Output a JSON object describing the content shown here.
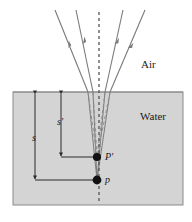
{
  "figure": {
    "media": {
      "upper_label": "Air",
      "lower_label": "Water",
      "water_fill_color": "#d4d4d4",
      "water_border_color": "#8a8a8a",
      "background_color": "#ffffff"
    },
    "points": [
      {
        "id": "object",
        "label": "p",
        "x": 97,
        "y": 180,
        "note": "actual object point"
      },
      {
        "id": "image",
        "label": "P'",
        "x": 97,
        "y": 157,
        "note": "apparent (virtual) image point"
      }
    ],
    "dimensions": [
      {
        "id": "true-depth",
        "label": "s",
        "x": 35,
        "y_top": 93,
        "y_bottom": 180
      },
      {
        "id": "apparent-depth",
        "label": "s'",
        "x": 61,
        "y_top": 93,
        "y_bottom": 157
      }
    ],
    "axis": {
      "id": "normal-line",
      "style": "dashed",
      "x": 99,
      "y_top": 12,
      "y_bottom": 204,
      "color": "#555555"
    },
    "rays": {
      "color": "#7a7a7a",
      "refracted_color": "#8a8a8a",
      "virtual_color": "#9a9a9a",
      "count": 4,
      "arrow_direction": "upward-outward",
      "air_rays": [
        {
          "id": "outer-left",
          "x_top": 55,
          "y_top": 10,
          "x_bottom": 88,
          "y_bottom": 92
        },
        {
          "id": "inner-left",
          "x_top": 76,
          "y_top": 10,
          "x_bottom": 93,
          "y_bottom": 92
        },
        {
          "id": "inner-right",
          "x_top": 123,
          "y_top": 10,
          "x_bottom": 105,
          "y_bottom": 92
        },
        {
          "id": "outer-right",
          "x_top": 145,
          "y_top": 10,
          "x_bottom": 110,
          "y_bottom": 92
        }
      ],
      "water_rays": [
        {
          "id": "water-outer-left",
          "x_top": 88,
          "y_top": 92,
          "x_bottom": 97,
          "y_bottom": 180
        },
        {
          "id": "water-inner-left",
          "x_top": 93,
          "y_top": 92,
          "x_bottom": 97,
          "y_bottom": 180
        },
        {
          "id": "water-inner-right",
          "x_top": 105,
          "y_top": 92,
          "x_bottom": 97,
          "y_bottom": 180
        },
        {
          "id": "water-outer-right",
          "x_top": 110,
          "y_top": 92,
          "x_bottom": 97,
          "y_bottom": 180
        }
      ],
      "virtual_rays": [
        {
          "id": "virtual-outer-left",
          "x_top": 88,
          "y_top": 92,
          "x_bottom": 97,
          "y_bottom": 157
        },
        {
          "id": "virtual-inner-left",
          "x_top": 93,
          "y_top": 92,
          "x_bottom": 97,
          "y_bottom": 157
        },
        {
          "id": "virtual-inner-right",
          "x_top": 105,
          "y_top": 92,
          "x_bottom": 97,
          "y_bottom": 157
        },
        {
          "id": "virtual-outer-right",
          "x_top": 110,
          "y_top": 92,
          "x_bottom": 97,
          "y_bottom": 157
        }
      ]
    },
    "water_rect": {
      "x": 13,
      "y": 92,
      "width": 170,
      "height": 113
    }
  }
}
